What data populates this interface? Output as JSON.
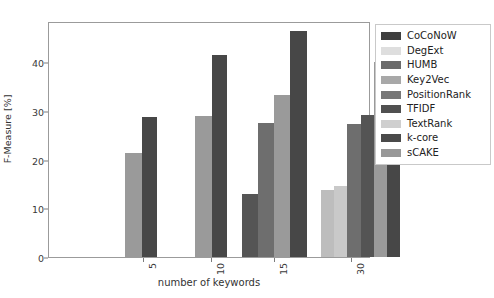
{
  "chart_data": {
    "type": "bar",
    "title": "",
    "xlabel": "number of keywords",
    "ylabel": "F-Measure [%]",
    "categories": [
      "5",
      "10",
      "15",
      "30"
    ],
    "ylim": [
      0,
      48.5
    ],
    "yticks": [
      0,
      10,
      20,
      30,
      40
    ],
    "grid": false,
    "legend_position": "right-outside",
    "orientation": "vertical",
    "grouped": true,
    "series": [
      {
        "name": "CoCoNoW",
        "color": "#3f3f3f",
        "values": [
          null,
          null,
          13.0,
          null
        ]
      },
      {
        "name": "DegExt",
        "color": "#d9d9d9",
        "values": [
          null,
          null,
          null,
          13.7
        ]
      },
      {
        "name": "HUMB",
        "color": "#6e6e6e",
        "values": [
          null,
          null,
          null,
          null
        ]
      },
      {
        "name": "Key2Vec",
        "color": "#c4c4c4",
        "values": [
          null,
          null,
          null,
          14.5
        ]
      },
      {
        "name": "PositionRank",
        "color": "#8a8a8a",
        "values": [
          null,
          null,
          27.5,
          27.4
        ]
      },
      {
        "name": "TFIDF",
        "color": "#4a4a4a",
        "values": [
          null,
          null,
          null,
          29.2
        ]
      },
      {
        "name": "TextRank",
        "color": "#bdbdbd",
        "values": [
          null,
          null,
          null,
          null
        ]
      },
      {
        "name": "k-core",
        "color": "#474747",
        "values": [
          28.7,
          41.5,
          46.5,
          45.8
        ]
      },
      {
        "name": "sCAKE",
        "color": "#9a9a9a",
        "values": [
          21.3,
          29.0,
          33.3,
          40.1
        ]
      }
    ],
    "bars": [
      {
        "group": "5",
        "series": "sCAKE",
        "value": 21.3,
        "color": "#9a9a9a"
      },
      {
        "group": "5",
        "series": "k-core",
        "value": 28.7,
        "color": "#474747"
      },
      {
        "group": "10",
        "series": "sCAKE",
        "value": 29.0,
        "color": "#9a9a9a"
      },
      {
        "group": "10",
        "series": "k-core",
        "value": 41.5,
        "color": "#474747"
      },
      {
        "group": "15",
        "series": "CoCoNoW",
        "value": 13.0,
        "color": "#555555"
      },
      {
        "group": "15",
        "series": "PositionRank",
        "value": 27.5,
        "color": "#6e6e6e"
      },
      {
        "group": "15",
        "series": "sCAKE",
        "value": 33.3,
        "color": "#9a9a9a"
      },
      {
        "group": "15",
        "series": "k-core",
        "value": 46.5,
        "color": "#474747"
      },
      {
        "group": "30",
        "series": "DegExt",
        "value": 13.7,
        "color": "#bdbdbd"
      },
      {
        "group": "30",
        "series": "Key2Vec",
        "value": 14.5,
        "color": "#c9c9c9"
      },
      {
        "group": "30",
        "series": "PositionRank",
        "value": 27.4,
        "color": "#6e6e6e"
      },
      {
        "group": "30",
        "series": "TFIDF",
        "value": 29.2,
        "color": "#545454"
      },
      {
        "group": "30",
        "series": "sCAKE",
        "value": 40.1,
        "color": "#9a9a9a"
      },
      {
        "group": "30",
        "series": "k-core",
        "value": 45.8,
        "color": "#474747"
      }
    ],
    "group_centers_px": [
      95,
      163,
      226,
      303
    ],
    "bar_layout": [
      {
        "group": "5",
        "x": 76,
        "w": 17
      },
      {
        "group": "5",
        "x": 93,
        "w": 15
      },
      {
        "group": "10",
        "x": 146,
        "w": 17
      },
      {
        "group": "10",
        "x": 163,
        "w": 15
      },
      {
        "group": "15",
        "x": 193,
        "w": 16
      },
      {
        "group": "15",
        "x": 209,
        "w": 16
      },
      {
        "group": "15",
        "x": 225,
        "w": 16
      },
      {
        "group": "15",
        "x": 241,
        "w": 17
      },
      {
        "group": "30",
        "x": 272,
        "w": 13
      },
      {
        "group": "30",
        "x": 285,
        "w": 13
      },
      {
        "group": "30",
        "x": 298,
        "w": 14
      },
      {
        "group": "30",
        "x": 312,
        "w": 13
      },
      {
        "group": "30",
        "x": 325,
        "w": 13
      },
      {
        "group": "30",
        "x": 338,
        "w": 13
      }
    ]
  },
  "legend": {
    "items": [
      {
        "label": "CoCoNoW",
        "color": "#3f3f3f"
      },
      {
        "label": "DegExt",
        "color": "#dedede"
      },
      {
        "label": "HUMB",
        "color": "#6b6b6b"
      },
      {
        "label": "Key2Vec",
        "color": "#a8a8a8"
      },
      {
        "label": "PositionRank",
        "color": "#777777"
      },
      {
        "label": "TFIDF",
        "color": "#505050"
      },
      {
        "label": "TextRank",
        "color": "#cfcfcf"
      },
      {
        "label": "k-core",
        "color": "#4a4a4a"
      },
      {
        "label": "sCAKE",
        "color": "#989898"
      }
    ]
  },
  "axes": {
    "ytick_labels": [
      "0",
      "10",
      "20",
      "30",
      "40"
    ],
    "xtick_labels": [
      "5",
      "10",
      "15",
      "30"
    ],
    "ylabel": "F-Measure [%]",
    "xlabel": "number of keywords"
  }
}
